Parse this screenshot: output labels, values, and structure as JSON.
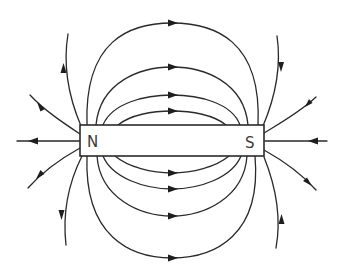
{
  "figure": {
    "magnet": {
      "north_label": "N",
      "south_label": "S"
    },
    "colors": {
      "line": "#2a2a2a",
      "background": "#ffffff"
    },
    "field_lines": {
      "closed_loops_above": 4,
      "closed_loops_below": 4,
      "open_lines_north": 5,
      "open_lines_south": 5,
      "direction": "out of N, into S"
    }
  }
}
